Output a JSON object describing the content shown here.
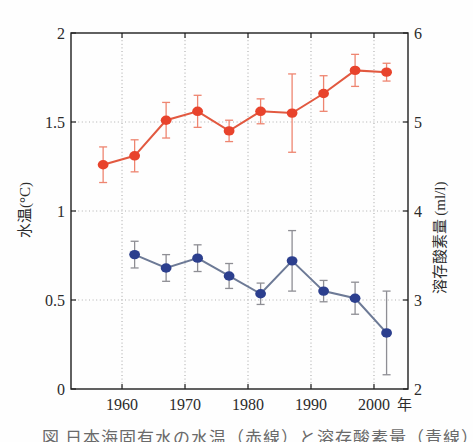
{
  "caption": {
    "text": "図 日本海固有水の水温（赤線）と溶存酸素量（青線）の経年変化"
  },
  "chart_data": {
    "type": "line",
    "title": "",
    "x_ticks": [
      1960,
      1970,
      1980,
      1990,
      2000
    ],
    "x_tick_labels": [
      "1960",
      "1970",
      "1980",
      "1990",
      "2000"
    ],
    "x_axis_suffix": "年",
    "x_range": [
      1951.9,
      2005.4
    ],
    "left_axis": {
      "label": "水温(°C)",
      "range": [
        0,
        2
      ],
      "ticks": [
        0,
        0.5,
        1,
        1.5,
        2
      ],
      "tick_labels": [
        "0",
        "0.5",
        "1",
        "1.5",
        "2"
      ]
    },
    "right_axis": {
      "label": "溶存酸素量 (ml/l)",
      "range": [
        2,
        6
      ],
      "ticks": [
        2,
        3,
        4,
        5,
        6
      ],
      "tick_labels": [
        "2",
        "3",
        "4",
        "5",
        "6"
      ]
    },
    "grid": {
      "vertical_years": [
        1960,
        1970,
        1980,
        1990,
        2000
      ],
      "horizontal_left_values": [
        0.5,
        1,
        1.5
      ],
      "style": "dotted"
    },
    "series": [
      {
        "name": "水温（赤線）",
        "axis": "left",
        "marker_color": "#e8432c",
        "line_color": "#e25940",
        "error_color": "#ee8570",
        "points": [
          {
            "x": 1957,
            "y": 1.26,
            "e": 0.1
          },
          {
            "x": 1962,
            "y": 1.31,
            "e": 0.09
          },
          {
            "x": 1967,
            "y": 1.51,
            "e": 0.1
          },
          {
            "x": 1972,
            "y": 1.56,
            "e": 0.09
          },
          {
            "x": 1977,
            "y": 1.45,
            "e": 0.06
          },
          {
            "x": 1982,
            "y": 1.56,
            "e": 0.07
          },
          {
            "x": 1987,
            "y": 1.55,
            "e": 0.22
          },
          {
            "x": 1992,
            "y": 1.66,
            "e": 0.1
          },
          {
            "x": 1997,
            "y": 1.79,
            "e": 0.09
          },
          {
            "x": 2002,
            "y": 1.78,
            "e": 0.05
          }
        ]
      },
      {
        "name": "溶存酸素量（青線）",
        "axis": "right",
        "marker_color": "#2c3f8e",
        "line_color": "#6d7a96",
        "error_color": "#8e8e94",
        "points": [
          {
            "x": 1962,
            "y": 3.51,
            "e": 0.15
          },
          {
            "x": 1967,
            "y": 3.36,
            "e": 0.15
          },
          {
            "x": 1972,
            "y": 3.47,
            "e": 0.15
          },
          {
            "x": 1977,
            "y": 3.27,
            "e": 0.14
          },
          {
            "x": 1982,
            "y": 3.07,
            "e": 0.12
          },
          {
            "x": 1987,
            "y": 3.44,
            "e": 0.34
          },
          {
            "x": 1992,
            "y": 3.1,
            "e": 0.12
          },
          {
            "x": 1997,
            "y": 3.02,
            "e": 0.18
          },
          {
            "x": 2002,
            "y": 2.63,
            "e": 0.47
          }
        ]
      }
    ]
  }
}
